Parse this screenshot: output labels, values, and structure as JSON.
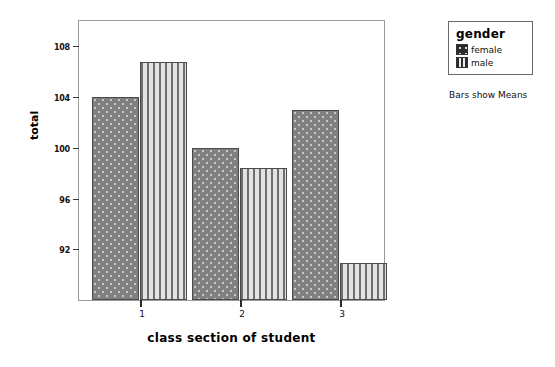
{
  "chart_data": {
    "type": "bar",
    "title": "",
    "xlabel": "class section of student",
    "ylabel": "total",
    "categories": [
      "1",
      "2",
      "3"
    ],
    "series": [
      {
        "name": "female",
        "values": [
          104.0,
          100.0,
          103.0
        ],
        "pattern": "dotted"
      },
      {
        "name": "male",
        "values": [
          106.8,
          98.4,
          90.9
        ],
        "pattern": "vertical-stripes"
      }
    ],
    "yticks": [
      92,
      96,
      100,
      104,
      108
    ],
    "ytick_labels": [
      "92",
      "96",
      "100",
      "104",
      "108"
    ],
    "ylim": [
      88,
      110
    ],
    "grid": false,
    "legend_position": "right-outside"
  },
  "axes": {
    "y_title": "total",
    "x_title": "class section of student",
    "y_ticks": [
      "108",
      "104",
      "100",
      "96",
      "92"
    ],
    "x_ticks": [
      "1",
      "2",
      "3"
    ]
  },
  "legend": {
    "title": "gender",
    "items": [
      {
        "label": "female",
        "swatch": "dotted-swatch-icon"
      },
      {
        "label": "male",
        "swatch": "striped-swatch-icon"
      }
    ]
  },
  "footnote": {
    "text": "Bars show Means"
  },
  "colors": {
    "female_fill": "#808080",
    "male_fill": "#d5d5d5",
    "bar_outline": "#4a4a4a",
    "frame": "#9a9a9a",
    "text": "#111111"
  }
}
